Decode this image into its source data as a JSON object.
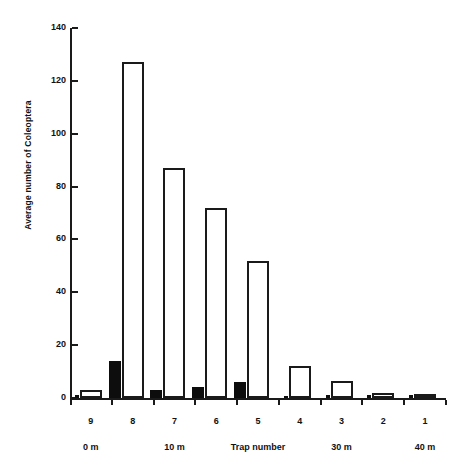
{
  "chart_data": {
    "type": "bar",
    "title": "",
    "subtitle": "",
    "xlabel": "Trap number",
    "ylabel": "Average number of Coleoptera",
    "categories": [
      "9",
      "8",
      "7",
      "6",
      "5",
      "4",
      "3",
      "2",
      "1"
    ],
    "series": [
      {
        "name": "open",
        "style": "white bar with black outline",
        "values": [
          3,
          127,
          87,
          72,
          52,
          12,
          6.5,
          2,
          1.5
        ]
      },
      {
        "name": "filled",
        "style": "solid black bar",
        "values": [
          1,
          14,
          3,
          4,
          6,
          0.5,
          1,
          1,
          1
        ]
      }
    ],
    "ylim": [
      0,
      140
    ],
    "yticks": [
      0,
      20,
      40,
      60,
      80,
      100,
      120,
      140
    ],
    "ytick_labels": [
      "0",
      "20",
      "40",
      "60",
      "80",
      "100",
      "120",
      "140"
    ],
    "grid": false,
    "legend": "none",
    "distance_labels": [
      {
        "text": "0 m",
        "category": "9"
      },
      {
        "text": "10 m",
        "category": "7"
      },
      {
        "text": "30 m",
        "category": "3"
      },
      {
        "text": "40 m",
        "category": "1"
      }
    ]
  },
  "axes": {
    "y_title": "Average number of Coleoptera",
    "x_title": "Trap number"
  },
  "colors": {
    "axis": "#1a1a1a",
    "bar_open_fill": "#ffffff",
    "bar_open_stroke": "#1a1a1a",
    "bar_filled": "#0d0d0d",
    "background": "#ffffff",
    "text": "#111111"
  }
}
